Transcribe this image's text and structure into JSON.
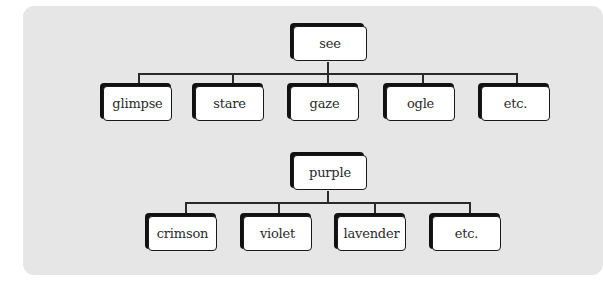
{
  "trees": [
    {
      "root": "see",
      "children": [
        "glimpse",
        "stare",
        "gaze",
        "ogle",
        "etc."
      ]
    },
    {
      "root": "purple",
      "children": [
        "crimson",
        "violet",
        "lavender",
        "etc."
      ]
    }
  ],
  "colors": {
    "panel": "#e6e6e6",
    "box_fill": "#ffffff",
    "box_shadow": "#111111",
    "line": "#2a2a2a"
  }
}
